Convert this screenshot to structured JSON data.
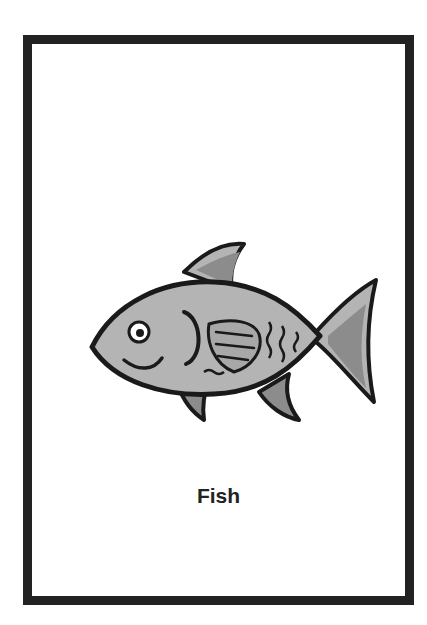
{
  "card": {
    "label": "Fish",
    "image": "fish-illustration",
    "colors": {
      "border": "#222222",
      "body": "#b4b4b4",
      "fin": "#8c8c8c",
      "outline": "#1a1a1a",
      "background": "#ffffff"
    }
  }
}
